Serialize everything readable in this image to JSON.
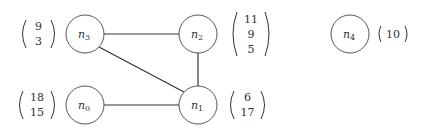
{
  "graph": {
    "nodes": [
      {
        "id": "n0",
        "base": "n",
        "sub": "0",
        "cx": 85,
        "cy": 105,
        "vector": [
          "18",
          "15"
        ],
        "vec_side": "left"
      },
      {
        "id": "n1",
        "base": "n",
        "sub": "1",
        "cx": 198,
        "cy": 105,
        "vector": [
          "6",
          "17"
        ],
        "vec_side": "right"
      },
      {
        "id": "n2",
        "base": "n",
        "sub": "2",
        "cx": 198,
        "cy": 34,
        "vector": [
          "11",
          "9",
          "5"
        ],
        "vec_side": "right"
      },
      {
        "id": "n3",
        "base": "n",
        "sub": "3",
        "cx": 85,
        "cy": 34,
        "vector": [
          "9",
          "3"
        ],
        "vec_side": "left"
      },
      {
        "id": "n4",
        "base": "n",
        "sub": "4",
        "cx": 350,
        "cy": 34,
        "vector": [
          "10"
        ],
        "vec_side": "right"
      }
    ],
    "edges": [
      [
        "n3",
        "n2"
      ],
      [
        "n3",
        "n1"
      ],
      [
        "n2",
        "n1"
      ],
      [
        "n0",
        "n1"
      ]
    ]
  },
  "labels": {
    "n0": {
      "base": "n",
      "sub": "0"
    },
    "n1": {
      "base": "n",
      "sub": "1"
    },
    "n2": {
      "base": "n",
      "sub": "2"
    },
    "n3": {
      "base": "n",
      "sub": "3"
    },
    "n4": {
      "base": "n",
      "sub": "4"
    }
  },
  "vectors": {
    "n0": [
      "18",
      "15"
    ],
    "n1": [
      "6",
      "17"
    ],
    "n2": [
      "11",
      "9",
      "5"
    ],
    "n3": [
      "9",
      "3"
    ],
    "n4": [
      "10"
    ]
  }
}
